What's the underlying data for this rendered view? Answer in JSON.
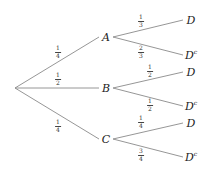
{
  "tree": {
    "root": {
      "x": 15,
      "y": 88
    },
    "level1": [
      {
        "id": "A",
        "label": "A",
        "x": 106,
        "y": 37,
        "prob": {
          "num": "1",
          "den": "4"
        },
        "prob_pos": {
          "x": 58,
          "y": 52
        }
      },
      {
        "id": "B",
        "label": "B",
        "x": 106,
        "y": 88,
        "prob": {
          "num": "1",
          "den": "2"
        },
        "prob_pos": {
          "x": 58,
          "y": 79
        }
      },
      {
        "id": "C",
        "label": "C",
        "x": 106,
        "y": 139,
        "prob": {
          "num": "1",
          "den": "4"
        },
        "prob_pos": {
          "x": 58,
          "y": 126
        }
      }
    ],
    "level2": [
      {
        "parent": "A",
        "label": "D",
        "complement": false,
        "x": 191,
        "y": 20,
        "prob": {
          "num": "1",
          "den": "3"
        },
        "prob_pos": {
          "x": 141,
          "y": 21
        }
      },
      {
        "parent": "A",
        "label": "D",
        "complement": true,
        "x": 191,
        "y": 55,
        "prob": {
          "num": "2",
          "den": "3"
        },
        "prob_pos": {
          "x": 141,
          "y": 52
        }
      },
      {
        "parent": "B",
        "label": "D",
        "complement": false,
        "x": 191,
        "y": 72,
        "prob": {
          "num": "1",
          "den": "2"
        },
        "prob_pos": {
          "x": 150,
          "y": 71
        }
      },
      {
        "parent": "B",
        "label": "D",
        "complement": true,
        "x": 191,
        "y": 106,
        "prob": {
          "num": "1",
          "den": "2"
        },
        "prob_pos": {
          "x": 150,
          "y": 105
        }
      },
      {
        "parent": "C",
        "label": "D",
        "complement": false,
        "x": 191,
        "y": 123,
        "prob": {
          "num": "1",
          "den": "4"
        },
        "prob_pos": {
          "x": 141,
          "y": 122
        }
      },
      {
        "parent": "C",
        "label": "D",
        "complement": true,
        "x": 191,
        "y": 157,
        "prob": {
          "num": "3",
          "den": "4"
        },
        "prob_pos": {
          "x": 141,
          "y": 155
        }
      }
    ],
    "complement_mark": "c",
    "line_color": "#8a8a8a"
  }
}
